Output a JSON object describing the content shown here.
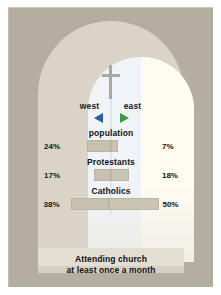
{
  "figure": {
    "caption_line1": "Attending church",
    "caption_line2": "at least once a month",
    "cross_icon": "cross-icon",
    "colors": {
      "background": "#b4aea1",
      "arch_frame": "#d9d4c7",
      "glass_left": "#f0f3f8",
      "glass_right": "#fffdf2",
      "bar": "#c7c1b0",
      "west_marker": "#2f5aa8",
      "east_marker": "#3f9b3f",
      "cross": "#a9a7a0"
    }
  },
  "legend": {
    "west_label": "west",
    "east_label": "east",
    "west_icon": "triangle-left-icon",
    "east_icon": "triangle-right-icon"
  },
  "chart_data": {
    "type": "bar",
    "title": "Attending church at least once a month",
    "subtitle": "",
    "xlabel": "",
    "ylabel": "",
    "orientation": "horizontal-diverging",
    "categories": [
      "population",
      "Protestants",
      "Catholics"
    ],
    "series": [
      {
        "name": "west",
        "values": [
          24,
          17,
          38
        ],
        "labels": [
          "24%",
          "17%",
          "38%"
        ],
        "color": "#c7c1b0",
        "marker_color": "#2f5aa8"
      },
      {
        "name": "east",
        "values": [
          7,
          18,
          50
        ],
        "labels": [
          "7%",
          "18%",
          "50%"
        ],
        "color": "#cac4b3",
        "marker_color": "#3f9b3f"
      }
    ],
    "unit": "%",
    "xlim": [
      0,
      50
    ],
    "grid": false,
    "legend_position": "top-center"
  },
  "rows": [
    {
      "label": "population",
      "west_pct": "24%",
      "east_pct": "7%",
      "west_width": "24px",
      "east_width": "7px"
    },
    {
      "label": "Protestants",
      "west_pct": "17%",
      "east_pct": "18%",
      "west_width": "17px",
      "east_width": "18px"
    },
    {
      "label": "Catholics",
      "west_pct": "38%",
      "east_pct": "50%",
      "west_width": "38px",
      "east_width": "50px"
    }
  ]
}
